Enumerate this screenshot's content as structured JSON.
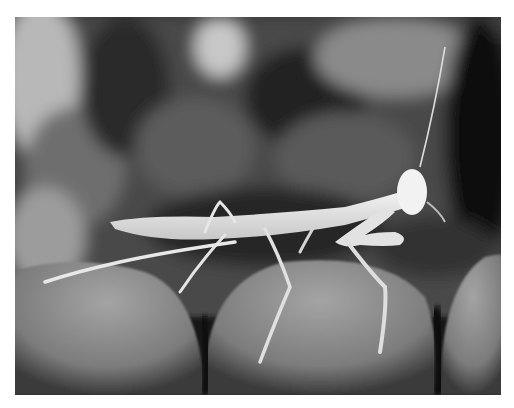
{
  "image": {
    "alt": "Grayscale macro photo of a pale praying mantis nymph standing on human fingertips against a dark blurred background",
    "subject": "praying mantis",
    "palette": {
      "background_dark": "#1e1e1e",
      "background_mid": "#5a5a5a",
      "background_light": "#b4b4b4",
      "mantis": "#ececec",
      "fingers": "#8c8c8c",
      "finger_shadow": "#141414"
    }
  }
}
